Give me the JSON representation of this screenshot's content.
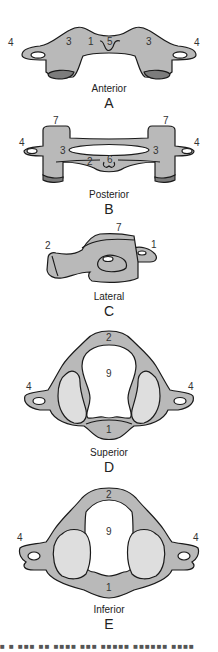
{
  "figure": {
    "colors": {
      "bone": "#b9b9b9",
      "facet": "#dedede",
      "shadow": "#7c7c7c",
      "outline": "#1a1a1a"
    },
    "views": [
      {
        "id": "A",
        "name": "Anterior",
        "letter": "A",
        "labels": {
          "left4": "4",
          "left3": "3",
          "one": "1",
          "five": "5",
          "right3": "3",
          "right4": "4"
        }
      },
      {
        "id": "B",
        "name": "Posterior",
        "letter": "B",
        "labels": {
          "left7": "7",
          "right7": "7",
          "left4": "4",
          "right4": "4",
          "left3": "3",
          "right3": "3",
          "two": "2",
          "six": "6"
        }
      },
      {
        "id": "C",
        "name": "Lateral",
        "letter": "C",
        "labels": {
          "two": "2",
          "seven": "7",
          "one": "1"
        }
      },
      {
        "id": "D",
        "name": "Superior",
        "letter": "D",
        "labels": {
          "two": "2",
          "nine": "9",
          "left4": "4",
          "right4": "4",
          "one": "1"
        }
      },
      {
        "id": "E",
        "name": "Inferior",
        "letter": "E",
        "labels": {
          "two": "2",
          "nine": "9",
          "left4": "4",
          "right4": "4",
          "one": "1"
        }
      }
    ],
    "caption_fragment": "■ ■ ■■■ ■■ ■■■■ ■■■ ■■■■■ ■■■■■■ ■■■■"
  }
}
